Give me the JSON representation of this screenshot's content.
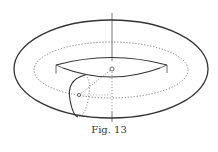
{
  "figure": {
    "caption": "Fig. 13",
    "colors": {
      "stroke": "#444444",
      "background": "#ffffff"
    }
  }
}
